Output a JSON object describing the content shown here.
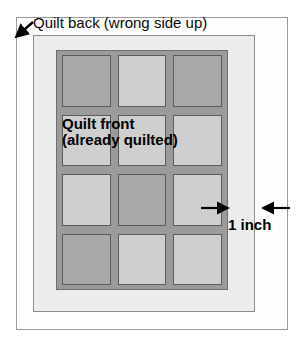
{
  "diagram": {
    "type": "quilt-binding-diagram",
    "labels": {
      "quilt_back": "Quilt back (wrong side up)",
      "quilt_front_line1": "Quilt  front",
      "quilt_front_line2": "(already  quilted)",
      "measurement": "1 inch"
    },
    "colors": {
      "page_background": "#ffffff",
      "outer_border": "#9a9a9a",
      "quilt_back_fill": "#ececec",
      "quilt_front_sashing": "#9b9b9b",
      "block_light": "#cfcfcf",
      "block_dark": "#a8a8a8",
      "block_border": "#5d5d5d",
      "text": "#000000"
    },
    "icons": {
      "corner_pointer": "diagonal-arrow-icon",
      "measure_left": "arrow-right-icon",
      "measure_right": "arrow-left-icon"
    },
    "grid": {
      "columns": 3,
      "rows": 4,
      "blocks": [
        {
          "row": 0,
          "col": 0,
          "shade": "dark"
        },
        {
          "row": 0,
          "col": 1,
          "shade": "light"
        },
        {
          "row": 0,
          "col": 2,
          "shade": "dark"
        },
        {
          "row": 1,
          "col": 0,
          "shade": "light"
        },
        {
          "row": 1,
          "col": 1,
          "shade": "light"
        },
        {
          "row": 1,
          "col": 2,
          "shade": "light"
        },
        {
          "row": 2,
          "col": 0,
          "shade": "light"
        },
        {
          "row": 2,
          "col": 1,
          "shade": "dark"
        },
        {
          "row": 2,
          "col": 2,
          "shade": "light"
        },
        {
          "row": 3,
          "col": 0,
          "shade": "dark"
        },
        {
          "row": 3,
          "col": 1,
          "shade": "light"
        },
        {
          "row": 3,
          "col": 2,
          "shade": "light"
        }
      ]
    }
  }
}
